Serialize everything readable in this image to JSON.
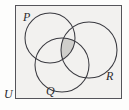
{
  "figure": {
    "kind": "venn-diagram",
    "width": 129,
    "height": 110,
    "background_color": "#fdfdfc"
  },
  "universe": {
    "label": "U",
    "label_name": "universal-set-label",
    "fill_color": "#f2f1ef",
    "border_color": "#55545a",
    "x": 15,
    "y": 5,
    "width": 107,
    "height": 94
  },
  "sets": [
    {
      "label": "P",
      "cx": 50,
      "cy": 38,
      "r": 25,
      "stroke": "#3a3a40"
    },
    {
      "label": "R",
      "cx": 89,
      "cy": 50,
      "r": 28,
      "stroke": "#3a3a40"
    },
    {
      "label": "Q",
      "cx": 62,
      "cy": 65,
      "r": 27,
      "stroke": "#3a3a40"
    }
  ],
  "shaded_region": {
    "name": "triple-intersection",
    "expression": "P ∩ Q ∩ R",
    "fill_color": "#cfcecb",
    "stroke_color": "#3a3a40"
  },
  "labels": {
    "p": "P",
    "q": "Q",
    "r": "R",
    "u": "U"
  }
}
